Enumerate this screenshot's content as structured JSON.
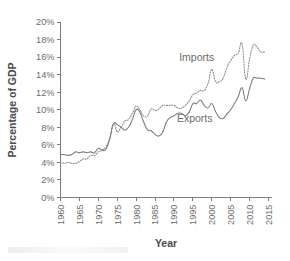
{
  "chart_data": {
    "type": "line",
    "title": "",
    "xlabel": "Year",
    "ylabel": "Percentage of GDP",
    "xlim": [
      1960,
      2015
    ],
    "ylim": [
      0,
      20
    ],
    "grid": false,
    "legend_position": "inline-annotation",
    "x_tick_labels": [
      "1960",
      "1965",
      "1970",
      "1975",
      "1980",
      "1985",
      "1990",
      "1995",
      "2000",
      "2005",
      "2010",
      "2015"
    ],
    "x_ticks": [
      1960,
      1965,
      1970,
      1975,
      1980,
      1985,
      1990,
      1995,
      2000,
      2005,
      2010,
      2015
    ],
    "y_tick_labels": [
      "0%",
      "2%",
      "4%",
      "6%",
      "8%",
      "10%",
      "12%",
      "14%",
      "16%",
      "18%",
      "20%"
    ],
    "y_ticks": [
      0,
      2,
      4,
      6,
      8,
      10,
      12,
      14,
      16,
      18,
      20
    ],
    "x": [
      1960,
      1961,
      1962,
      1963,
      1964,
      1965,
      1966,
      1967,
      1968,
      1969,
      1970,
      1971,
      1972,
      1973,
      1974,
      1975,
      1976,
      1977,
      1978,
      1979,
      1980,
      1981,
      1982,
      1983,
      1984,
      1985,
      1986,
      1987,
      1988,
      1989,
      1990,
      1991,
      1992,
      1993,
      1994,
      1995,
      1996,
      1997,
      1998,
      1999,
      2000,
      2001,
      2002,
      2003,
      2004,
      2005,
      2006,
      2007,
      2008,
      2009,
      2010,
      2011,
      2012,
      2013,
      2014
    ],
    "series": [
      {
        "name": "Imports",
        "style": "dotted",
        "color": "#8a8a8a",
        "label_annotation": "Imports",
        "values": [
          4.0,
          3.9,
          4.0,
          3.9,
          3.9,
          4.1,
          4.4,
          4.4,
          4.8,
          4.8,
          5.2,
          5.4,
          5.8,
          6.6,
          8.4,
          7.5,
          8.0,
          8.7,
          8.9,
          9.6,
          10.4,
          10.0,
          9.3,
          9.3,
          10.1,
          9.9,
          10.1,
          10.5,
          10.5,
          10.5,
          10.5,
          10.2,
          10.2,
          10.5,
          11.0,
          11.7,
          11.9,
          12.2,
          12.2,
          13.0,
          14.6,
          13.2,
          13.2,
          13.6,
          14.8,
          15.6,
          16.2,
          16.4,
          17.5,
          13.5,
          15.8,
          17.4,
          17.1,
          16.6,
          16.6
        ]
      },
      {
        "name": "Exports",
        "style": "solid",
        "color": "#7a7a7a",
        "label_annotation": "Exports",
        "values": [
          4.9,
          4.9,
          4.8,
          4.9,
          5.2,
          5.1,
          5.2,
          5.1,
          5.2,
          5.1,
          5.6,
          5.4,
          5.5,
          6.7,
          8.4,
          8.3,
          8.0,
          7.7,
          8.0,
          8.9,
          10.0,
          9.7,
          8.6,
          7.7,
          7.6,
          7.2,
          7.0,
          7.4,
          8.6,
          9.1,
          9.3,
          9.6,
          9.6,
          9.3,
          9.7,
          10.7,
          10.7,
          11.1,
          10.5,
          10.2,
          10.7,
          9.8,
          9.1,
          9.0,
          9.5,
          10.0,
          10.7,
          11.5,
          12.5,
          11.0,
          12.4,
          13.6,
          13.6,
          13.6,
          13.5
        ]
      }
    ],
    "annotations": [
      {
        "text": "Imports",
        "x": 1996.0,
        "y": 15.6
      },
      {
        "text": "Exports",
        "x": 1995.5,
        "y": 8.6
      }
    ]
  },
  "axes": {
    "x_title": "Year",
    "y_title": "Percentage of GDP"
  }
}
